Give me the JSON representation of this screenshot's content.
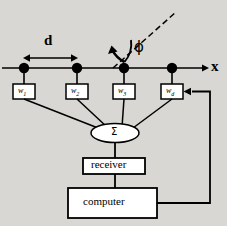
{
  "figure": {
    "axis_label": "x",
    "spacing_label": "d",
    "angle_label": "ϕ",
    "sum_label": "Σ",
    "receiver_label": "receiver",
    "computer_label": "computer",
    "weights": [
      {
        "id": "w1",
        "base": "w",
        "sub": "1"
      },
      {
        "id": "w2",
        "base": "w",
        "sub": "2"
      },
      {
        "id": "w3",
        "base": "w",
        "sub": "3"
      },
      {
        "id": "wd",
        "base": "w",
        "sub": "d"
      }
    ],
    "colors": {
      "ink": "#000000",
      "page": "#d9d7d3",
      "faded_text": "#b3afa9"
    }
  },
  "background_text": "   tion to a direction of arrival\n   signals. By building a set of\n   the signals  is  1 ... and the\n   value of a direction that sum\n   ly. The null filter  of the array\n   can be  realized  by  the non  uniform\n   a distribution  of the  array  is the\n   pattern  is  formed  with  an  array\n   thus  differs  the  or  pattern,  as  shown\n   ing a gain of  noise, the SNR and\n   pattern,  the  non  uniform  value  level\n   ing 2. The  nonlinear  equation  that  was\n   by a  formulation  of  gain,  as  shown\n   was  a  distribution  of  the  same  of  the  first\n   shown  in  the  pattern  is  equation"
}
